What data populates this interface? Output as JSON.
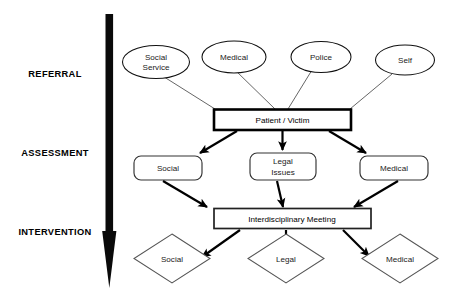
{
  "diagram": {
    "background_color": "#ffffff",
    "stroke_color": "#000000",
    "stages": [
      {
        "id": "referral",
        "label": "REFERRAL"
      },
      {
        "id": "assessment",
        "label": "ASSESSMENT"
      },
      {
        "id": "intervention",
        "label": "INTERVENTION"
      }
    ],
    "flow_arrow": {
      "name": "downward-progression-arrow",
      "direction": "down",
      "color": "#0a0a0a"
    },
    "referral_sources": [
      {
        "id": "social-service",
        "label_line1": "Social",
        "label_line2": "Service",
        "shape": "ellipse"
      },
      {
        "id": "medical",
        "label_line1": "Medical",
        "label_line2": "",
        "shape": "ellipse"
      },
      {
        "id": "police",
        "label_line1": "Police",
        "label_line2": "",
        "shape": "ellipse"
      },
      {
        "id": "self",
        "label_line1": "Self",
        "label_line2": "",
        "shape": "ellipse"
      }
    ],
    "central_node": {
      "id": "patient-victim",
      "label": "Patient / Victim",
      "shape": "rectangle"
    },
    "assessment_nodes": [
      {
        "id": "social",
        "label_line1": "Social",
        "label_line2": "",
        "shape": "rounded-rectangle"
      },
      {
        "id": "legal-issues",
        "label_line1": "Legal",
        "label_line2": "Issues",
        "shape": "rounded-rectangle"
      },
      {
        "id": "medical",
        "label_line1": "Medical",
        "label_line2": "",
        "shape": "rounded-rectangle"
      }
    ],
    "meeting_node": {
      "id": "interdisciplinary-meeting",
      "label": "Interdisciplinary Meeting",
      "shape": "rectangle"
    },
    "intervention_nodes": [
      {
        "id": "social",
        "label": "Social",
        "shape": "diamond"
      },
      {
        "id": "legal",
        "label": "Legal",
        "shape": "diamond"
      },
      {
        "id": "medical",
        "label": "Medical",
        "shape": "diamond"
      }
    ]
  }
}
